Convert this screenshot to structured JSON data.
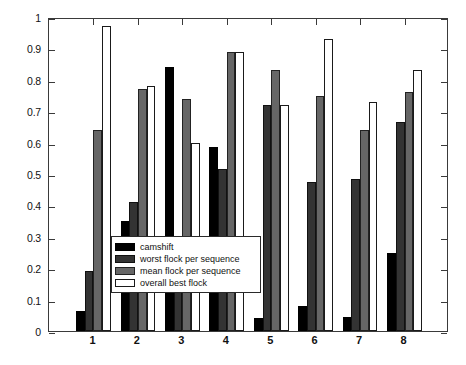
{
  "chart_data": {
    "type": "bar",
    "title": "",
    "xlabel": "",
    "ylabel": "fraction of sequence tracked",
    "categories": [
      "1",
      "2",
      "3",
      "4",
      "5",
      "6",
      "7",
      "8"
    ],
    "ylim": [
      0,
      1
    ],
    "yticks": [
      "0",
      "0.1",
      "0.2",
      "0.3",
      "0.4",
      "0.5",
      "0.6",
      "0.7",
      "0.8",
      "0.9",
      "1"
    ],
    "ytick_values": [
      0,
      0.1,
      0.2,
      0.3,
      0.4,
      0.5,
      0.6,
      0.7,
      0.8,
      0.9,
      1
    ],
    "grid": false,
    "legend_position": "lower-left-inside",
    "series": [
      {
        "name": "camshift",
        "color": "#000000",
        "values": [
          0.065,
          0.35,
          0.84,
          0.585,
          0.04,
          0.08,
          0.045,
          0.25
        ]
      },
      {
        "name": "worst flock per sequence",
        "color": "#333333",
        "values": [
          0.19,
          0.41,
          0.285,
          0.515,
          0.72,
          0.475,
          0.485,
          0.665
        ]
      },
      {
        "name": "mean flock per sequence",
        "color": "#666666",
        "values": [
          0.64,
          0.77,
          0.74,
          0.89,
          0.83,
          0.75,
          0.64,
          0.76
        ]
      },
      {
        "name": "overall best flock",
        "color": "#ffffff",
        "values": [
          0.97,
          0.78,
          0.6,
          0.89,
          0.72,
          0.93,
          0.73,
          0.83
        ]
      }
    ]
  },
  "legend": {
    "items": [
      {
        "label": "camshift"
      },
      {
        "label": "worst flock per sequence"
      },
      {
        "label": "mean flock per sequence"
      },
      {
        "label": "overall best flock"
      }
    ]
  }
}
